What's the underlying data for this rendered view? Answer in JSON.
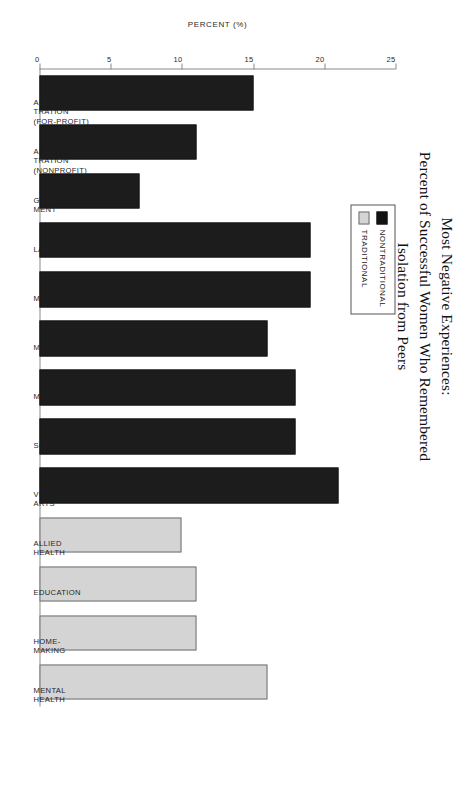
{
  "chart_data": {
    "type": "bar",
    "orientation": "vertical-rotated",
    "title": "Most Negative Experiences:\nPercent of Successful Women Who Remembered\nIsolation from Peers",
    "title_lines": [
      "Most Negative Experiences:",
      "Percent of Successful Women Who Remembered",
      "Isolation from Peers"
    ],
    "xlabel": "",
    "ylabel": "PERCENT (%)",
    "ylim": [
      0,
      25
    ],
    "yticks": [
      0,
      5,
      10,
      15,
      20,
      25
    ],
    "ytick_labels": [
      "0",
      "5",
      "10",
      "15",
      "20",
      "25"
    ],
    "grid": false,
    "legend_position": "upper-area",
    "legend": [
      {
        "name": "NONTRADITIONAL",
        "color": "#121212"
      },
      {
        "name": "TRADITIONAL",
        "color": "#d4d4d4"
      }
    ],
    "categories": [
      "ADMINIS-TRATION (FOR-PROFIT)",
      "ADMINIS-TRATION (NONPROFIT)",
      "GOVERN-MENT",
      "LAW",
      "MEDIA",
      "MEDICINE",
      "MUSIC",
      "SCIENCE",
      "VISUAL ARTS",
      "ALLIED HEALTH",
      "EDUCATION",
      "HOME-MAKING",
      "MENTAL HEALTH"
    ],
    "bars": [
      {
        "category_lines": [
          "ADMINIS-",
          "TRATION",
          "(FOR-PROFIT)"
        ],
        "value": 15,
        "group": "NONTRADITIONAL"
      },
      {
        "category_lines": [
          "ADMINIS-",
          "TRATION",
          "(NONPROFIT)"
        ],
        "value": 11,
        "group": "NONTRADITIONAL"
      },
      {
        "category_lines": [
          "GOVERN-",
          "MENT"
        ],
        "value": 7,
        "group": "NONTRADITIONAL"
      },
      {
        "category_lines": [
          "LAW"
        ],
        "value": 19,
        "group": "NONTRADITIONAL"
      },
      {
        "category_lines": [
          "MEDIA"
        ],
        "value": 19,
        "group": "NONTRADITIONAL"
      },
      {
        "category_lines": [
          "MEDICINE"
        ],
        "value": 16,
        "group": "NONTRADITIONAL"
      },
      {
        "category_lines": [
          "MUSIC"
        ],
        "value": 18,
        "group": "NONTRADITIONAL"
      },
      {
        "category_lines": [
          "SCIENCE"
        ],
        "value": 18,
        "group": "NONTRADITIONAL"
      },
      {
        "category_lines": [
          "VISUAL",
          "ARTS"
        ],
        "value": 21,
        "group": "NONTRADITIONAL"
      },
      {
        "category_lines": [
          "ALLIED",
          "HEALTH"
        ],
        "value": 10,
        "group": "TRADITIONAL"
      },
      {
        "category_lines": [
          "EDUCATION"
        ],
        "value": 11,
        "group": "TRADITIONAL"
      },
      {
        "category_lines": [
          "HOME-",
          "MAKING"
        ],
        "value": 11,
        "group": "TRADITIONAL"
      },
      {
        "category_lines": [
          "MENTAL",
          "HEALTH"
        ],
        "value": 16,
        "group": "TRADITIONAL"
      }
    ],
    "series": [
      {
        "name": "NONTRADITIONAL",
        "color": "#121212",
        "values": [
          15,
          11,
          7,
          19,
          19,
          16,
          18,
          18,
          21,
          null,
          null,
          null,
          null
        ]
      },
      {
        "name": "TRADITIONAL",
        "color": "#d4d4d4",
        "values": [
          null,
          null,
          null,
          null,
          null,
          null,
          null,
          null,
          null,
          10,
          11,
          11,
          16
        ]
      }
    ]
  },
  "colors": {
    "nontraditional": "#121212",
    "traditional": "#d4d4d4",
    "axis": "#8a8a8a",
    "text": "#1a1a1a",
    "background": "#ffffff"
  }
}
